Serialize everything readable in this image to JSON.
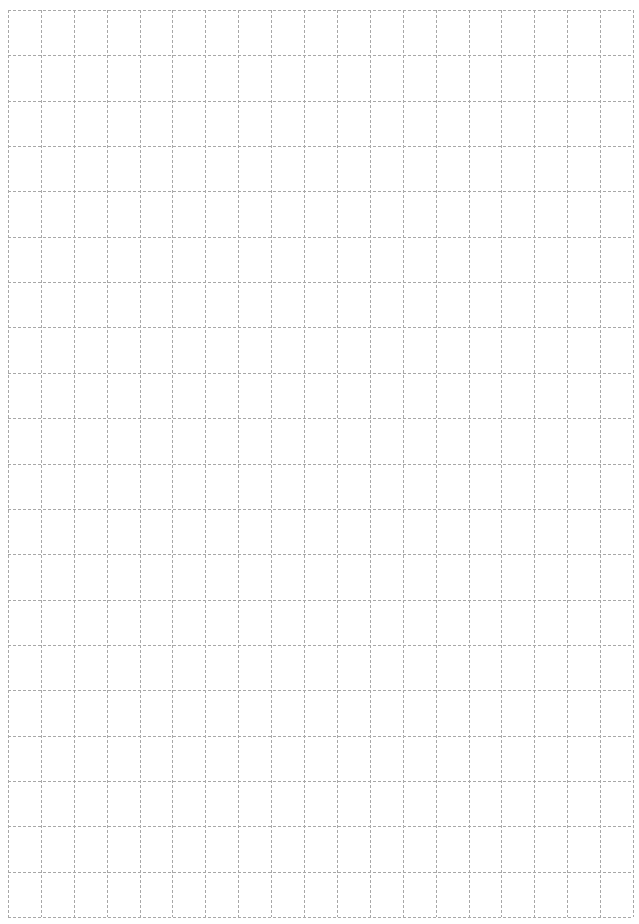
{
  "page": {
    "type": "blank grid paper",
    "background": "#ffffff",
    "line_color": "#a8a8a8",
    "line_style": "dashed"
  },
  "grid": {
    "left": 8,
    "top": 10,
    "right": 633,
    "bottom": 917,
    "columns": 19,
    "rows": 20
  }
}
